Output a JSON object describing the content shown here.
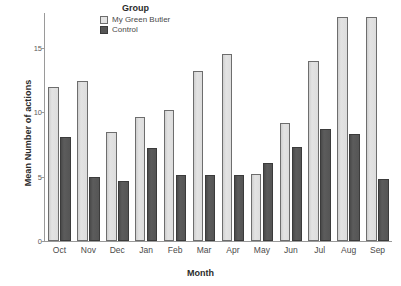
{
  "chart_data": {
    "type": "bar",
    "title": "",
    "xlabel": "Month",
    "ylabel": "Mean Number of actions",
    "ylim": [
      0,
      18
    ],
    "yticks": [
      0,
      5,
      10,
      15
    ],
    "ytick_labels": [
      "0",
      "5",
      "10",
      "15"
    ],
    "grid": false,
    "legend_title": "Group",
    "legend_position": "top-center",
    "categories": [
      "Oct",
      "Nov",
      "Dec",
      "Jan",
      "Feb",
      "Mar",
      "Apr",
      "May",
      "Jun",
      "Jul",
      "Aug",
      "Sep"
    ],
    "series": [
      {
        "name": "My Green Butler",
        "color": "#dcdcdc",
        "values": [
          12.0,
          12.4,
          8.5,
          9.6,
          10.2,
          13.2,
          14.5,
          5.2,
          9.2,
          14.0,
          17.4,
          17.4
        ]
      },
      {
        "name": "Control",
        "color": "#565656",
        "values": [
          8.1,
          5.0,
          4.7,
          7.2,
          5.1,
          5.1,
          5.1,
          6.1,
          7.3,
          8.7,
          8.3,
          4.8
        ]
      }
    ]
  },
  "axes": {
    "y_title": "Mean Number of actions",
    "x_title": "Month"
  },
  "legend": {
    "title": "Group",
    "items": [
      {
        "label": "My Green Butler",
        "swatch": "light-gray-swatch"
      },
      {
        "label": "Control",
        "swatch": "dark-gray-swatch"
      }
    ]
  }
}
